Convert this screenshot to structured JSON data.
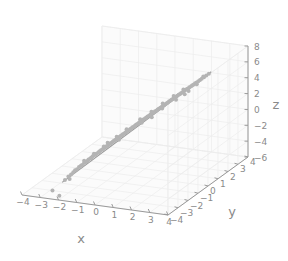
{
  "chart_data": {
    "type": "scatter",
    "projection": "3d",
    "title": "",
    "xlabel": "x",
    "ylabel": "y",
    "zlabel": "z",
    "xlim": [
      -4,
      4
    ],
    "ylim": [
      -4,
      4
    ],
    "zlim": [
      -6,
      8
    ],
    "xticks": [
      -4,
      -3,
      -2,
      -1,
      0,
      1,
      2,
      3,
      4
    ],
    "yticks": [
      -4,
      -3,
      -2,
      -1,
      0,
      1,
      2,
      3,
      4
    ],
    "zticks": [
      -6,
      -4,
      -2,
      0,
      2,
      4,
      6,
      8
    ],
    "xticklabels": [
      "−4",
      "−3",
      "−2",
      "−1",
      "0",
      "1",
      "2",
      "3",
      "4"
    ],
    "yticklabels": [
      "−4",
      "−3",
      "−2",
      "−1",
      "0",
      "1",
      "2",
      "3",
      "4"
    ],
    "zticklabels": [
      "−6",
      "−4",
      "−2",
      "0",
      "2",
      "4",
      "6",
      "8"
    ],
    "grid": true,
    "legend": null,
    "point_color": "#b4b4b4",
    "line_color": "#9a9a9a",
    "pane_color": "#fbfbfb",
    "grid_color": "#ededed",
    "axis_color": "#9a9a9a",
    "tick_label_color": "#8a8a8a",
    "background_color": "#ffffff",
    "marker_size": 2.0,
    "series": [
      {
        "name": "observations",
        "kind": "scatter",
        "points": [
          [
            -2.52,
            -2.41,
            -5.1
          ],
          [
            -2.39,
            -2.3,
            -4.72
          ],
          [
            -2.31,
            -2.18,
            -4.55
          ],
          [
            -2.22,
            -2.12,
            -4.3
          ],
          [
            -2.18,
            -2.02,
            -4.12
          ],
          [
            -2.1,
            -1.96,
            -4.02
          ],
          [
            -2.04,
            -1.88,
            -3.8
          ],
          [
            -1.98,
            -1.8,
            -3.7
          ],
          [
            -1.92,
            -1.79,
            -3.58
          ],
          [
            -1.86,
            -1.7,
            -3.4
          ],
          [
            -1.8,
            -1.66,
            -3.31
          ],
          [
            -1.74,
            -1.6,
            -3.18
          ],
          [
            -1.7,
            -1.55,
            -3.05
          ],
          [
            -1.64,
            -1.48,
            -2.96
          ],
          [
            -1.6,
            -1.44,
            -2.85
          ],
          [
            -1.55,
            -1.4,
            -2.72
          ],
          [
            -1.5,
            -1.34,
            -2.64
          ],
          [
            -1.44,
            -1.3,
            -2.52
          ],
          [
            -1.4,
            -1.26,
            -2.44
          ],
          [
            -1.34,
            -1.2,
            -2.32
          ],
          [
            -1.3,
            -1.16,
            -2.22
          ],
          [
            -1.26,
            -1.1,
            -2.14
          ],
          [
            -1.2,
            -1.06,
            -2.02
          ],
          [
            -1.16,
            -1.0,
            -1.94
          ],
          [
            -1.1,
            -0.96,
            -1.84
          ],
          [
            -1.06,
            -0.92,
            -1.74
          ],
          [
            -1.0,
            -0.88,
            -1.66
          ],
          [
            -0.96,
            -0.82,
            -1.55
          ],
          [
            -0.92,
            -0.78,
            -1.46
          ],
          [
            -0.86,
            -0.74,
            -1.36
          ],
          [
            -0.82,
            -0.7,
            -1.28
          ],
          [
            -0.78,
            -0.66,
            -1.18
          ],
          [
            -0.72,
            -0.62,
            -1.08
          ],
          [
            -0.68,
            -0.58,
            -1.0
          ],
          [
            -0.64,
            -0.54,
            -0.9
          ],
          [
            -0.6,
            -0.5,
            -0.82
          ],
          [
            -0.54,
            -0.46,
            -0.72
          ],
          [
            -0.5,
            -0.42,
            -0.64
          ],
          [
            -0.46,
            -0.38,
            -0.54
          ],
          [
            -0.4,
            -0.34,
            -0.45
          ],
          [
            -0.36,
            -0.3,
            -0.36
          ],
          [
            -0.32,
            -0.26,
            -0.28
          ],
          [
            -0.28,
            -0.22,
            -0.18
          ],
          [
            -0.22,
            -0.18,
            -0.1
          ],
          [
            -0.18,
            -0.14,
            0.0
          ],
          [
            -0.14,
            -0.1,
            0.08
          ],
          [
            -0.1,
            -0.06,
            0.18
          ],
          [
            -0.04,
            -0.02,
            0.26
          ],
          [
            0.0,
            0.02,
            0.36
          ],
          [
            0.04,
            0.06,
            0.44
          ],
          [
            0.1,
            0.1,
            0.54
          ],
          [
            0.14,
            0.14,
            0.62
          ],
          [
            0.18,
            0.18,
            0.72
          ],
          [
            0.24,
            0.22,
            0.8
          ],
          [
            0.28,
            0.26,
            0.9
          ],
          [
            0.32,
            0.3,
            0.98
          ],
          [
            0.38,
            0.34,
            1.08
          ],
          [
            0.42,
            0.38,
            1.16
          ],
          [
            0.46,
            0.42,
            1.26
          ],
          [
            0.52,
            0.46,
            1.35
          ],
          [
            0.56,
            0.5,
            1.44
          ],
          [
            0.6,
            0.54,
            1.52
          ],
          [
            0.66,
            0.58,
            1.62
          ],
          [
            0.7,
            0.62,
            1.7
          ],
          [
            0.74,
            0.66,
            1.8
          ],
          [
            0.8,
            0.7,
            1.88
          ],
          [
            0.84,
            0.74,
            1.98
          ],
          [
            0.88,
            0.78,
            2.06
          ],
          [
            0.94,
            0.82,
            2.16
          ],
          [
            0.98,
            0.86,
            2.24
          ],
          [
            1.04,
            0.9,
            2.34
          ],
          [
            1.08,
            0.94,
            2.42
          ],
          [
            1.12,
            0.98,
            2.52
          ],
          [
            1.18,
            1.02,
            2.6
          ],
          [
            1.22,
            1.06,
            2.7
          ],
          [
            1.26,
            1.12,
            2.8
          ],
          [
            1.32,
            1.16,
            2.88
          ],
          [
            1.36,
            1.2,
            2.98
          ],
          [
            1.42,
            1.24,
            3.06
          ],
          [
            1.46,
            1.3,
            3.16
          ],
          [
            1.52,
            1.34,
            3.26
          ],
          [
            1.56,
            1.38,
            3.34
          ],
          [
            1.6,
            1.44,
            3.44
          ],
          [
            1.66,
            1.48,
            3.52
          ],
          [
            1.7,
            1.52,
            3.62
          ],
          [
            1.76,
            1.58,
            3.72
          ],
          [
            1.8,
            1.62,
            3.8
          ],
          [
            1.86,
            1.66,
            3.9
          ],
          [
            1.9,
            1.72,
            4.0
          ],
          [
            1.96,
            1.76,
            4.08
          ],
          [
            2.0,
            1.8,
            4.18
          ],
          [
            2.06,
            1.86,
            4.28
          ],
          [
            2.1,
            1.9,
            4.36
          ],
          [
            2.16,
            1.94,
            4.46
          ],
          [
            2.2,
            2.0,
            4.56
          ],
          [
            2.26,
            2.04,
            4.64
          ],
          [
            2.32,
            2.1,
            4.76
          ],
          [
            2.38,
            2.16,
            4.88
          ],
          [
            2.44,
            2.22,
            5.0
          ],
          [
            2.52,
            2.3,
            5.16
          ],
          [
            2.6,
            2.38,
            5.32
          ],
          [
            2.7,
            2.46,
            5.5
          ],
          [
            -1.15,
            -1.02,
            -1.72
          ],
          [
            -1.05,
            -0.82,
            -1.4
          ],
          [
            -0.72,
            -0.52,
            -0.8
          ],
          [
            -0.35,
            -0.2,
            -0.02
          ],
          [
            0.12,
            0.3,
            0.92
          ],
          [
            0.55,
            0.64,
            1.7
          ],
          [
            0.95,
            1.04,
            2.5
          ],
          [
            1.35,
            1.4,
            3.22
          ],
          [
            1.72,
            1.7,
            3.9
          ],
          [
            -1.9,
            -1.62,
            -3.2
          ],
          [
            -1.55,
            -1.28,
            -2.5
          ],
          [
            0.3,
            0.12,
            0.7
          ],
          [
            1.05,
            0.8,
            2.1
          ],
          [
            1.58,
            1.22,
            3.0
          ],
          [
            2.05,
            1.62,
            3.9
          ],
          [
            -0.55,
            -0.6,
            -1.05
          ],
          [
            0.7,
            0.4,
            1.25
          ],
          [
            1.9,
            1.5,
            3.55
          ],
          [
            2.3,
            1.98,
            4.5
          ],
          [
            2.46,
            2.34,
            5.2
          ],
          [
            -2.3,
            -2.34,
            -4.95
          ]
        ]
      },
      {
        "name": "fit-line",
        "kind": "line",
        "points": [
          [
            -2.62,
            -2.5,
            -5.35
          ],
          [
            2.78,
            2.55,
            5.7
          ]
        ]
      },
      {
        "name": "outliers",
        "kind": "scatter",
        "points": [
          [
            -2.2,
            -3.55,
            -5.95
          ],
          [
            -2.85,
            -3.05,
            -5.95
          ]
        ]
      }
    ]
  },
  "figure": {
    "axis_label_x": "x",
    "axis_label_y": "y",
    "axis_label_z": "z"
  }
}
